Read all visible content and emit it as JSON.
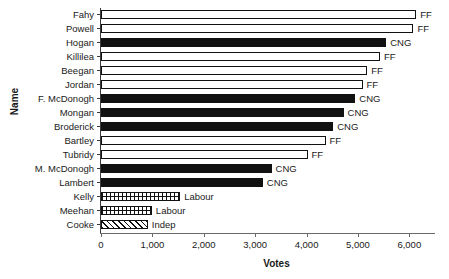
{
  "chart_data": {
    "type": "bar",
    "orientation": "horizontal",
    "title": "",
    "xlabel": "Votes",
    "ylabel": "Name",
    "xlim": [
      0,
      6500
    ],
    "ylim": null,
    "grid": false,
    "legend": "none",
    "xticks": [
      0,
      1000,
      2000,
      3000,
      4000,
      5000,
      6000
    ],
    "xtick_labels": [
      "0",
      "1,000",
      "2,000",
      "3,000",
      "4,000",
      "5,000",
      "6,000"
    ],
    "categories": [
      "Fahy",
      "Powell",
      "Hogan",
      "Killilea",
      "Beegan",
      "Jordan",
      "F. McDonogh",
      "Mongan",
      "Broderick",
      "Bartley",
      "Tubridy",
      "M. McDonogh",
      "Lambert",
      "Kelly",
      "Meehan",
      "Cooke"
    ],
    "values": [
      6135,
      6080,
      5550,
      5430,
      5180,
      5090,
      4950,
      4720,
      4520,
      4370,
      4020,
      3320,
      3150,
      1540,
      990,
      910
    ],
    "point_labels": [
      "FF",
      "FF",
      "CNG",
      "FF",
      "FF",
      "FF",
      "CNG",
      "CNG",
      "CNG",
      "FF",
      "FF",
      "CNG",
      "CNG",
      "Labour",
      "Labour",
      "Indep"
    ],
    "fills": [
      "ff",
      "ff",
      "cng",
      "ff",
      "ff",
      "ff",
      "cng",
      "cng",
      "cng",
      "ff",
      "ff",
      "cng",
      "cng",
      "labour",
      "labour",
      "indep"
    ],
    "party_styles": {
      "ff": "hollow-white",
      "cng": "solid-black",
      "labour": "checkered",
      "indep": "diagonal-hatch"
    },
    "colors": {
      "bar_outline": "#111111",
      "bar_fill_solid": "#111111",
      "bar_fill_hollow": "#ffffff",
      "axis": "#3a3a3a",
      "text": "#1a1a1a",
      "background": "#ffffff"
    }
  }
}
